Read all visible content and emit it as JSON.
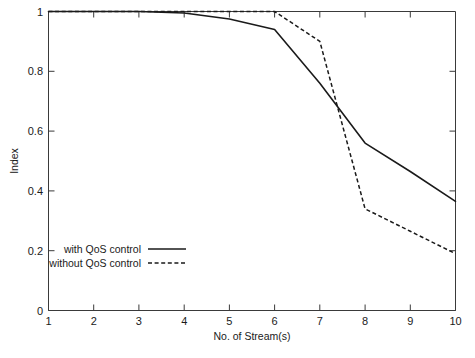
{
  "chart_data": {
    "type": "line",
    "title": "",
    "xlabel": "No. of Stream(s)",
    "ylabel": "Index",
    "xlim": [
      1,
      10
    ],
    "ylim": [
      0,
      1
    ],
    "xticks": [
      "1",
      "2",
      "3",
      "4",
      "5",
      "6",
      "7",
      "8",
      "9",
      "10"
    ],
    "yticks": [
      "0",
      "0.2",
      "0.4",
      "0.6",
      "0.8",
      "1"
    ],
    "grid": false,
    "legend_position": "lower-left-inside",
    "x": [
      1,
      2,
      3,
      4,
      5,
      6,
      7,
      8,
      9,
      10
    ],
    "series": [
      {
        "name": "with QoS control",
        "style": "solid",
        "color": "#1a1a1a",
        "values": [
          1.0,
          1.0,
          1.0,
          0.995,
          0.975,
          0.94,
          0.76,
          0.56,
          0.465,
          0.365
        ]
      },
      {
        "name": "without QoS control",
        "style": "dashed",
        "color": "#1a1a1a",
        "values": [
          1.0,
          1.0,
          1.0,
          1.0,
          1.0,
          1.0,
          0.9,
          0.34,
          0.265,
          0.19
        ]
      }
    ]
  },
  "legend": {
    "entries": [
      {
        "label": "with QoS control",
        "style": "solid"
      },
      {
        "label": "without QoS control",
        "style": "dashed"
      }
    ]
  },
  "caption": {
    "text": ""
  }
}
